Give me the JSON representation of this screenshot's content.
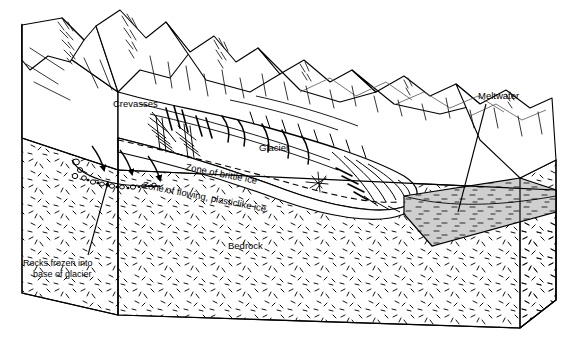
{
  "figure": {
    "kind": "block-diagram",
    "background_color": "#ffffff",
    "line_color": "#000000",
    "water_fill_color": "#c8c8c8"
  },
  "labels": {
    "crevasses": "Crevasses",
    "glacier": "Glacier",
    "meltwater": "Meltwater",
    "zone_brittle": "Zone of brittle ice",
    "zone_flowing": "Zone of flowing, plasticlike ice",
    "bedrock": "Bedrock",
    "rocks_line1": "Rocks frozen into",
    "rocks_line2": "base of glacier"
  },
  "features": [
    {
      "name": "mountain-range",
      "description": "Jagged peaks with shaded hatching along the back of the block"
    },
    {
      "name": "glacier-body",
      "description": "Valley glacier flowing from upper left to lower right"
    },
    {
      "name": "crevasse-field",
      "description": "Hatched slashes and curved arcs on the upper glacier surface"
    },
    {
      "name": "flow-arrows",
      "description": "Three curved arrows with solid triangular heads showing ice flow direction"
    },
    {
      "name": "basal-debris",
      "description": "Small rounded rock clasts frozen along the glacier base"
    },
    {
      "name": "meltwater-pool",
      "description": "Gray stippled water body at the glacier terminus"
    },
    {
      "name": "bedrock-mass",
      "description": "Stippled bedrock forming the cut block faces"
    }
  ]
}
